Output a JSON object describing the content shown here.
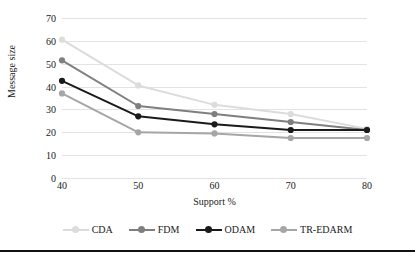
{
  "chart_data": {
    "type": "line",
    "title": "",
    "xlabel": "Support %",
    "ylabel": "Message size",
    "categories": [
      "40",
      "50",
      "60",
      "70",
      "80"
    ],
    "x": [
      40,
      50,
      60,
      70,
      80
    ],
    "xlim": [
      40,
      80
    ],
    "ylim": [
      0,
      70
    ],
    "yticks": [
      0,
      10,
      20,
      30,
      40,
      50,
      60,
      70
    ],
    "grid": true,
    "legend_position": "bottom",
    "series": [
      {
        "name": "CDA",
        "color": "#dcdcdc",
        "values": [
          60.5,
          40.5,
          32.0,
          28.0,
          21.5
        ]
      },
      {
        "name": "FDM",
        "color": "#7f7f7f",
        "values": [
          51.5,
          31.5,
          28.0,
          24.5,
          21.0
        ]
      },
      {
        "name": "ODAM",
        "color": "#1a1a1a",
        "values": [
          42.5,
          27.0,
          23.5,
          21.0,
          21.0
        ]
      },
      {
        "name": "TR-EDARM",
        "color": "#a6a6a6",
        "values": [
          37.0,
          20.0,
          19.5,
          17.5,
          17.5
        ]
      }
    ]
  },
  "axis": {
    "ytick_labels": [
      "70",
      "60",
      "50",
      "40",
      "30",
      "20",
      "10",
      "0"
    ],
    "xtick_labels": [
      "40",
      "50",
      "60",
      "70",
      "80"
    ]
  },
  "colors": {
    "gridline": "#e3e3e3",
    "text": "#1a1a1a",
    "background": "#ffffff",
    "rule": "#111111"
  }
}
